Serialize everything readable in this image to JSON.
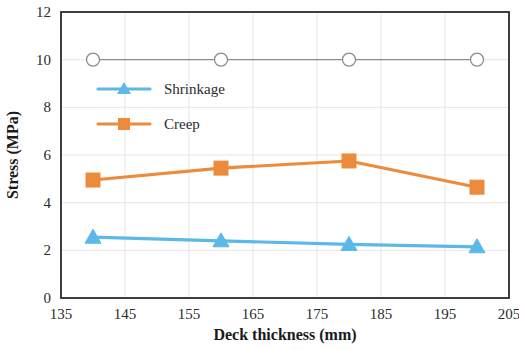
{
  "chart_data": {
    "type": "line",
    "title": "",
    "xlabel": "Deck thickness (mm)",
    "ylabel": "Stress (MPa)",
    "xlim": [
      135,
      205
    ],
    "ylim": [
      0,
      12
    ],
    "xticks": [
      135,
      145,
      155,
      165,
      175,
      185,
      195,
      205
    ],
    "yticks": [
      0,
      2,
      4,
      6,
      8,
      10,
      12
    ],
    "grid": true,
    "legend_position": "upper-left-inside",
    "x": [
      140,
      160,
      180,
      200
    ],
    "series": [
      {
        "name": "Limit",
        "values": [
          10,
          10,
          10,
          10
        ],
        "color": "#8c8c8c",
        "marker": "open-circle",
        "in_legend": false
      },
      {
        "name": "Shrinkage",
        "values": [
          2.55,
          2.4,
          2.25,
          2.15
        ],
        "color": "#5bb8e8",
        "marker": "triangle",
        "in_legend": true
      },
      {
        "name": "Creep",
        "values": [
          4.95,
          5.45,
          5.75,
          4.65
        ],
        "color": "#ed8b3c",
        "marker": "square",
        "in_legend": true
      }
    ]
  },
  "axis": {
    "x_tick_labels": [
      "135",
      "145",
      "155",
      "165",
      "175",
      "185",
      "195",
      "205"
    ],
    "y_tick_labels": [
      "0",
      "2",
      "4",
      "6",
      "8",
      "10",
      "12"
    ],
    "x_title": "Deck thickness (mm)",
    "y_title": "Stress (MPa)"
  },
  "legend": {
    "entries": [
      {
        "label": "Shrinkage",
        "color": "#5bb8e8",
        "marker": "triangle"
      },
      {
        "label": "Creep",
        "color": "#ed8b3c",
        "marker": "square"
      }
    ]
  },
  "colors": {
    "shrinkage": "#5bb8e8",
    "creep": "#ed8b3c",
    "limit": "#8c8c8c",
    "axis": "#2b2b2b",
    "grid": "#e6e6e6"
  }
}
